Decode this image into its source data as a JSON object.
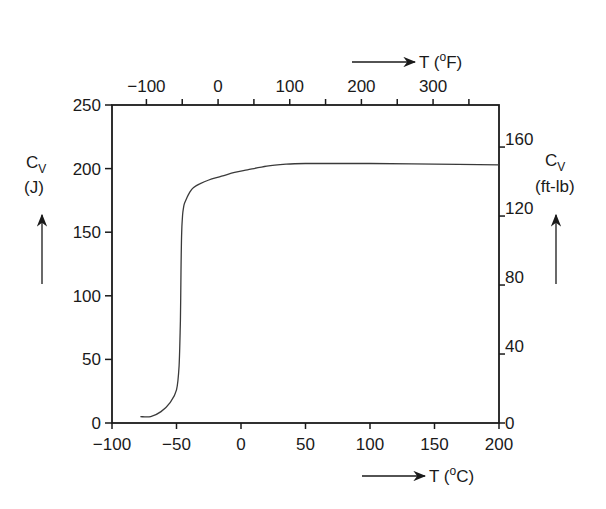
{
  "chart_data": {
    "type": "line",
    "title": "",
    "xlabel": "T (°C)",
    "ylabel": "Cv (J)",
    "x2label": "T (°F)",
    "y2label": "Cv (ft-lb)",
    "xlim": [
      -100,
      200
    ],
    "ylim": [
      0,
      250
    ],
    "grid": false,
    "legend": "none",
    "x_ticks": [
      -100,
      -50,
      0,
      50,
      100,
      150,
      200
    ],
    "y_ticks": [
      0,
      50,
      100,
      150,
      200,
      250
    ],
    "x2_ticks": [
      -100,
      0,
      100,
      200,
      300
    ],
    "y2_ticks": [
      0,
      40,
      80,
      120,
      160
    ],
    "series": [
      {
        "name": "Charpy impact energy",
        "x": [
          -78,
          -70,
          -62,
          -55,
          -50,
          -48,
          -47,
          -46.5,
          -46,
          -45.5,
          -45,
          -44,
          -42,
          -40,
          -37,
          -32,
          -25,
          -15,
          -5,
          5,
          20,
          35,
          50,
          75,
          100,
          150,
          200
        ],
        "y": [
          5,
          5,
          9,
          16,
          26,
          45,
          80,
          120,
          150,
          160,
          166,
          172,
          177,
          181,
          185,
          188,
          191,
          194,
          197,
          199,
          202,
          203.5,
          204,
          204,
          204,
          203.5,
          203
        ]
      }
    ]
  },
  "labels": {
    "y_left_main": "C",
    "y_left_sub": "V",
    "y_left_unit": "(J)",
    "y_right_main": "C",
    "y_right_sub": "V",
    "y_right_unit": "(ft-lb)",
    "x_bottom": "T (",
    "x_bottom_deg": "o",
    "x_bottom_unit": "C)",
    "x_top": "T (",
    "x_top_deg": "o",
    "x_top_unit": "F)"
  }
}
